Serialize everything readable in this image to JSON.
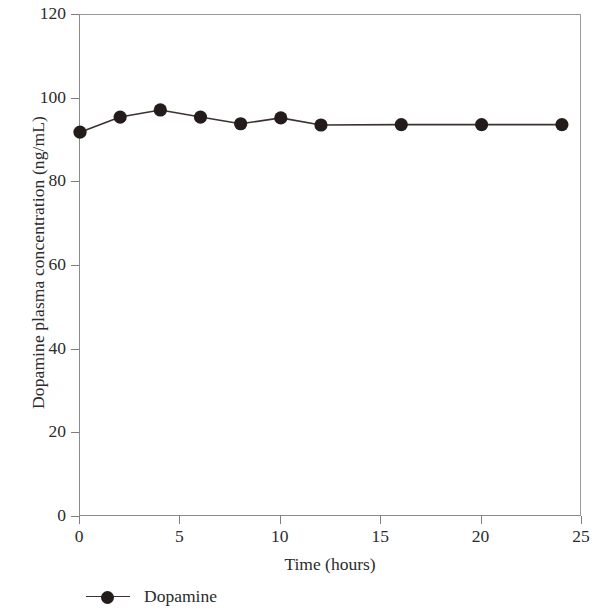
{
  "chart_data": {
    "type": "line",
    "title": "",
    "subtitle": "",
    "xlabel": "Time (hours)",
    "ylabel": "Dopamine plasma concentration (ng/mL)",
    "xlim": [
      0,
      25
    ],
    "ylim": [
      0,
      120
    ],
    "xticks": [
      0,
      5,
      10,
      15,
      20,
      25
    ],
    "yticks": [
      0,
      20,
      40,
      60,
      80,
      100,
      120
    ],
    "xtick_labels": [
      "0",
      "5",
      "10",
      "15",
      "20",
      "25"
    ],
    "ytick_labels": [
      "0",
      "20",
      "40",
      "60",
      "80",
      "100",
      "120"
    ],
    "grid": false,
    "legend_position": "below-left",
    "marker": "filled-circle",
    "marker_color": "#231c1a",
    "line_color": "#3a3330",
    "x": [
      0,
      2,
      4,
      6,
      8,
      10,
      12,
      16,
      20,
      24
    ],
    "series": [
      {
        "name": "Dopamine",
        "values": [
          92.0,
          95.6,
          97.3,
          95.6,
          94.0,
          95.4,
          93.7,
          93.8,
          93.8,
          93.8
        ]
      }
    ],
    "legend": [
      {
        "label": "Dopamine",
        "marker": "filled-circle",
        "color": "#231c1a"
      }
    ]
  }
}
